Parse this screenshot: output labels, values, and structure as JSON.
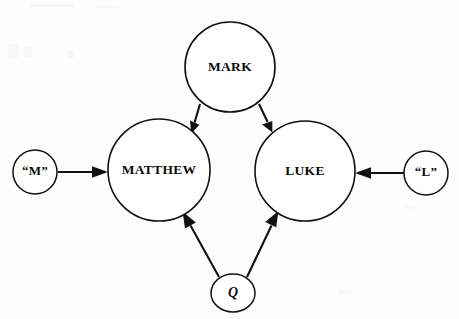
{
  "diagram": {
    "background_color": "#fdfdfd",
    "ink_color": "#111111",
    "nodes": [
      {
        "id": "mark",
        "label": "MARK",
        "shape": "circle",
        "cx": 230,
        "cy": 67,
        "r": 45,
        "label_size": "major"
      },
      {
        "id": "matthew",
        "label": "MATTHEW",
        "shape": "circle",
        "cx": 159,
        "cy": 170,
        "r": 51,
        "label_size": "major"
      },
      {
        "id": "luke",
        "label": "LUKE",
        "shape": "circle",
        "cx": 305,
        "cy": 171,
        "r": 50,
        "label_size": "major"
      },
      {
        "id": "m-source",
        "label": "“M”",
        "shape": "circle",
        "cx": 35,
        "cy": 172,
        "r": 22,
        "label_size": "minor"
      },
      {
        "id": "l-source",
        "label": "“L”",
        "shape": "circle",
        "cx": 426,
        "cy": 173,
        "r": 22,
        "label_size": "minor"
      },
      {
        "id": "q-source",
        "label": "Q",
        "shape": "ellipse",
        "cx": 233,
        "cy": 293,
        "rx": 22,
        "ry": 19,
        "label_size": "q"
      }
    ],
    "edges": [
      {
        "id": "mark-to-matthew",
        "from": "mark",
        "to": "matthew",
        "x1": 200,
        "y1": 104,
        "x2": 192,
        "y2": 131,
        "arrow_at": "end"
      },
      {
        "id": "mark-to-luke",
        "from": "mark",
        "to": "luke",
        "x1": 259,
        "y1": 104,
        "x2": 272,
        "y2": 131,
        "arrow_at": "end"
      },
      {
        "id": "m-to-matthew",
        "from": "m-source",
        "to": "matthew",
        "x1": 58,
        "y1": 172,
        "x2": 108,
        "y2": 172,
        "arrow_at": "end"
      },
      {
        "id": "l-to-luke",
        "from": "l-source",
        "to": "luke",
        "x1": 404,
        "y1": 173,
        "x2": 355,
        "y2": 173,
        "arrow_at": "end"
      },
      {
        "id": "q-to-matthew",
        "from": "q-source",
        "to": "matthew",
        "x1": 219,
        "y1": 277,
        "x2": 183,
        "y2": 212,
        "arrow_at": "end"
      },
      {
        "id": "q-to-luke",
        "from": "q-source",
        "to": "luke",
        "x1": 247,
        "y1": 277,
        "x2": 278,
        "y2": 212,
        "arrow_at": "end"
      }
    ]
  }
}
